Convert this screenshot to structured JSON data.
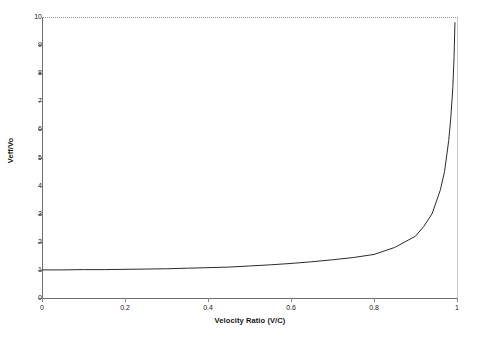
{
  "chart_data": {
    "type": "line",
    "title": "",
    "xlabel": "Velocity Ratio (V/C)",
    "ylabel": "Veff/Vo",
    "xlim": [
      0,
      1
    ],
    "ylim": [
      0,
      10
    ],
    "xticks": [
      "0",
      "0.2",
      "0.4",
      "0.6",
      "0.8",
      "1"
    ],
    "xtick_values": [
      0,
      0.2,
      0.4,
      0.6,
      0.8,
      1
    ],
    "yticks": [
      "0",
      "1",
      "2",
      "3",
      "4",
      "5",
      "6",
      "7",
      "8",
      "9",
      "10"
    ],
    "ytick_values": [
      0,
      1,
      2,
      3,
      4,
      5,
      6,
      7,
      8,
      9,
      10
    ],
    "grid": false,
    "legend": false,
    "series": [
      {
        "name": "Veff/Vo",
        "color": "#2b2b2b",
        "x": [
          0.0,
          0.05,
          0.1,
          0.15,
          0.2,
          0.25,
          0.3,
          0.35,
          0.4,
          0.45,
          0.5,
          0.55,
          0.6,
          0.65,
          0.7,
          0.75,
          0.8,
          0.85,
          0.9,
          0.92,
          0.94,
          0.96,
          0.97,
          0.98,
          0.985,
          0.99,
          0.993,
          0.995
        ],
        "y": [
          1.0,
          1.0,
          1.01,
          1.01,
          1.02,
          1.03,
          1.04,
          1.06,
          1.08,
          1.1,
          1.14,
          1.18,
          1.23,
          1.29,
          1.36,
          1.44,
          1.55,
          1.8,
          2.2,
          2.55,
          3.0,
          3.85,
          4.5,
          5.6,
          6.4,
          7.5,
          8.6,
          9.8
        ]
      }
    ]
  }
}
